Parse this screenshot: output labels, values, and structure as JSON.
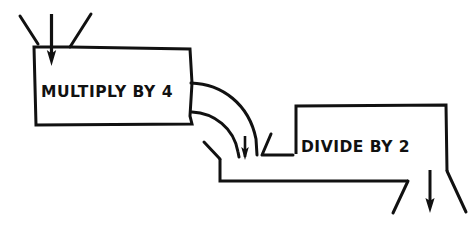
{
  "diagram": {
    "style": "hand-drawn line art",
    "background_color": "#ffffff",
    "ink_color": "#111111",
    "nodes": [
      {
        "id": "multiply-box",
        "label": "MULTIPLY BY 4",
        "shape": "notched-rectangle",
        "label_x": 40,
        "label_y": 97
      },
      {
        "id": "divide-box",
        "label": "DIVIDE BY 2",
        "shape": "notched-rectangle",
        "label_x": 300,
        "label_y": 152
      }
    ],
    "connectors": [
      {
        "id": "input-arrow",
        "type": "arrow",
        "direction": "down",
        "target": "multiply-box"
      },
      {
        "id": "pipe-bend",
        "type": "curved-pipe",
        "direction": "down",
        "from": "multiply-box",
        "to": "divide-box"
      },
      {
        "id": "output-arrow",
        "type": "arrow",
        "direction": "down",
        "source": "divide-box"
      }
    ]
  }
}
